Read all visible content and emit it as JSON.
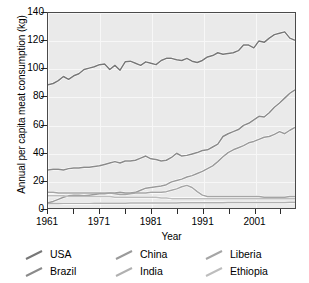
{
  "chart_data": {
    "type": "line",
    "title": "",
    "xlabel": "Year",
    "ylabel": "Annual per capita meat consumption (kg)",
    "xlim": [
      1961,
      2009
    ],
    "ylim": [
      0,
      140
    ],
    "xticks": [
      1961,
      1971,
      1981,
      1991,
      2001
    ],
    "xtick_labels": [
      "1961",
      "1971",
      "1981",
      "1991",
      "2001"
    ],
    "yticks": [
      0,
      20,
      40,
      60,
      80,
      100,
      120,
      140
    ],
    "ytick_labels": [
      "0",
      "20",
      "40",
      "60",
      "80",
      "100",
      "120",
      "140"
    ],
    "grid": true,
    "legend_position": "below",
    "plot_background": "#eaeaea",
    "x": [
      1961,
      1962,
      1963,
      1964,
      1965,
      1966,
      1967,
      1968,
      1969,
      1970,
      1971,
      1972,
      1973,
      1974,
      1975,
      1976,
      1977,
      1978,
      1979,
      1980,
      1981,
      1982,
      1983,
      1984,
      1985,
      1986,
      1987,
      1988,
      1989,
      1990,
      1991,
      1992,
      1993,
      1994,
      1995,
      1996,
      1997,
      1998,
      1999,
      2000,
      2001,
      2002,
      2003,
      2004,
      2005,
      2006,
      2007,
      2008,
      2009
    ],
    "series": [
      {
        "name": "USA",
        "color": "#777777",
        "values": [
          88.5,
          89.5,
          91.5,
          94.5,
          92.5,
          95.0,
          96.5,
          99.5,
          100.5,
          101.5,
          103.0,
          103.5,
          99.5,
          102.5,
          99.0,
          105.0,
          105.5,
          104.0,
          102.5,
          105.0,
          104.0,
          103.0,
          106.0,
          107.5,
          107.5,
          106.5,
          106.0,
          107.5,
          105.5,
          104.5,
          106.0,
          108.5,
          109.5,
          111.5,
          110.5,
          111.0,
          111.5,
          113.0,
          117.0,
          117.0,
          115.0,
          120.0,
          119.0,
          122.0,
          124.5,
          125.5,
          126.5,
          122.0,
          120.5
        ]
      },
      {
        "name": "Brazil",
        "color": "#8a8a8a",
        "values": [
          27.5,
          28.0,
          28.0,
          27.5,
          28.5,
          29.0,
          29.0,
          29.5,
          29.5,
          30.0,
          30.5,
          31.5,
          32.5,
          33.5,
          32.5,
          34.0,
          34.0,
          34.5,
          36.0,
          37.5,
          35.5,
          35.0,
          34.0,
          34.5,
          36.5,
          39.5,
          37.5,
          38.0,
          39.0,
          40.0,
          41.5,
          42.0,
          44.0,
          46.0,
          51.5,
          53.5,
          55.0,
          56.5,
          59.5,
          61.0,
          63.5,
          66.0,
          65.5,
          68.5,
          72.5,
          75.5,
          79.0,
          82.5,
          85.0
        ]
      },
      {
        "name": "China",
        "color": "#9a9a9a",
        "values": [
          4.0,
          5.0,
          6.5,
          8.0,
          9.0,
          9.5,
          9.5,
          9.0,
          9.5,
          10.0,
          10.5,
          10.5,
          11.0,
          11.0,
          11.5,
          11.0,
          11.0,
          11.5,
          13.0,
          14.5,
          15.0,
          15.5,
          16.0,
          17.0,
          19.0,
          20.0,
          21.0,
          22.5,
          23.5,
          25.0,
          26.5,
          28.5,
          30.5,
          33.5,
          37.0,
          40.0,
          42.0,
          43.5,
          45.0,
          47.0,
          48.0,
          49.5,
          51.0,
          51.5,
          53.0,
          55.0,
          53.5,
          56.0,
          58.0
        ]
      },
      {
        "name": "India",
        "color": "#b0b0b0",
        "values": [
          3.5,
          3.5,
          3.5,
          3.6,
          3.6,
          3.6,
          3.6,
          3.6,
          3.6,
          3.7,
          3.7,
          3.7,
          3.7,
          3.7,
          3.7,
          3.7,
          3.8,
          3.8,
          3.8,
          3.8,
          3.8,
          3.8,
          3.9,
          3.9,
          3.9,
          3.9,
          4.0,
          4.0,
          4.0,
          4.0,
          4.0,
          4.0,
          4.1,
          4.1,
          4.1,
          4.2,
          4.2,
          4.2,
          4.3,
          4.3,
          4.3,
          4.3,
          4.3,
          4.3,
          4.3,
          4.3,
          4.3,
          4.4,
          4.4
        ]
      },
      {
        "name": "Liberia",
        "color": "#a5a5a5",
        "values": [
          11.5,
          11.5,
          11.0,
          11.0,
          11.0,
          11.0,
          11.0,
          11.0,
          11.0,
          11.0,
          11.0,
          11.0,
          11.0,
          10.5,
          10.0,
          10.0,
          10.5,
          11.0,
          11.0,
          11.0,
          11.5,
          11.5,
          11.5,
          12.0,
          13.0,
          14.0,
          15.5,
          16.5,
          15.0,
          12.0,
          9.5,
          8.5,
          8.5,
          8.5,
          8.5,
          8.5,
          8.5,
          8.5,
          8.5,
          8.5,
          8.5,
          8.5,
          8.0,
          8.0,
          8.0,
          8.0,
          8.0,
          8.5,
          8.5
        ]
      },
      {
        "name": "Ethiopia",
        "color": "#bdbdbd",
        "values": [
          9.0,
          9.0,
          9.0,
          9.0,
          8.5,
          8.5,
          8.5,
          8.5,
          8.5,
          8.5,
          8.5,
          8.5,
          8.5,
          8.0,
          8.0,
          8.0,
          8.0,
          8.0,
          8.0,
          8.0,
          8.0,
          8.0,
          7.5,
          7.5,
          7.0,
          7.0,
          7.0,
          7.0,
          7.0,
          7.0,
          7.0,
          7.0,
          7.0,
          7.0,
          7.0,
          7.0,
          7.0,
          7.0,
          7.0,
          7.0,
          7.0,
          7.0,
          7.0,
          7.0,
          7.0,
          7.0,
          7.0,
          7.0,
          7.0
        ]
      }
    ]
  },
  "legend": {
    "rows": [
      [
        {
          "label": "USA",
          "series": "USA"
        },
        {
          "label": "China",
          "series": "China"
        },
        {
          "label": "Liberia",
          "series": "Liberia"
        }
      ],
      [
        {
          "label": "Brazil",
          "series": "Brazil"
        },
        {
          "label": "India",
          "series": "India"
        },
        {
          "label": "Ethiopia",
          "series": "Ethiopia"
        }
      ]
    ]
  }
}
